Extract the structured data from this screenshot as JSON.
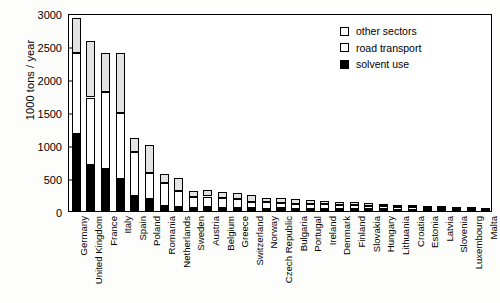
{
  "chart_data": {
    "type": "bar",
    "subtype": "stacked-vertical",
    "title": "",
    "xlabel": "",
    "ylabel": "1000 tons / year",
    "ylim": [
      0,
      3000
    ],
    "yticks": [
      0,
      500,
      1000,
      1500,
      2000,
      2500,
      3000
    ],
    "grid": false,
    "legend_position": "top-right",
    "categories": [
      "Germany",
      "United Kingdom",
      "France",
      "Italy",
      "Spain",
      "Poland",
      "Romania",
      "Netherlands",
      "Sweden",
      "Austria",
      "Belgium",
      "Greece",
      "Switzerland",
      "Norway",
      "Czech Republic",
      "Bulgaria",
      "Portugal",
      "Ireland",
      "Denmark",
      "Finland",
      "Slovakia",
      "Hungary",
      "Lithuania",
      "Croatia",
      "Estonia",
      "Latvia",
      "Slovenia",
      "Luxembourg",
      "Malta"
    ],
    "series": [
      {
        "name": "solvent use",
        "color": "#000000",
        "values": [
          1170,
          690,
          640,
          490,
          220,
          180,
          80,
          55,
          45,
          60,
          50,
          45,
          40,
          35,
          40,
          30,
          30,
          25,
          25,
          25,
          25,
          25,
          15,
          15,
          10,
          10,
          10,
          6,
          4
        ]
      },
      {
        "name": "road transport",
        "color": "#ffffff",
        "values": [
          1220,
          1030,
          1160,
          990,
          680,
          400,
          345,
          255,
          165,
          160,
          145,
          130,
          100,
          95,
          75,
          80,
          75,
          75,
          70,
          65,
          55,
          50,
          45,
          40,
          35,
          30,
          25,
          20,
          10
        ]
      },
      {
        "name": "other sectors",
        "color": "#e3e3e3",
        "values": [
          540,
          860,
          590,
          920,
          200,
          420,
          140,
          185,
          100,
          95,
          95,
          95,
          105,
          65,
          85,
          65,
          60,
          50,
          45,
          40,
          40,
          35,
          30,
          25,
          25,
          20,
          15,
          9,
          6
        ]
      }
    ],
    "totals": [
      2930,
      2580,
      2390,
      2400,
      1100,
      1000,
      565,
      495,
      310,
      315,
      290,
      270,
      245,
      195,
      200,
      175,
      165,
      150,
      140,
      130,
      120,
      110,
      90,
      80,
      70,
      60,
      50,
      35,
      20
    ]
  },
  "legend": {
    "items": [
      {
        "label": "other sectors",
        "swatch": "sw-other"
      },
      {
        "label": "road transport",
        "swatch": "sw-road"
      },
      {
        "label": "solvent use",
        "swatch": "sw-solvent"
      }
    ]
  }
}
